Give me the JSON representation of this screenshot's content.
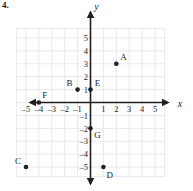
{
  "problem": {
    "number": "4."
  },
  "chart_data": {
    "type": "scatter",
    "title": "",
    "xlabel": "x",
    "ylabel": "y",
    "xlim": [
      -6,
      6
    ],
    "ylim": [
      -6,
      6
    ],
    "grid": true,
    "legend": "none",
    "x_ticks": [
      -5,
      -4,
      -3,
      -2,
      -1,
      1,
      2,
      3,
      4,
      5
    ],
    "y_ticks": [
      5,
      4,
      3,
      2,
      1,
      -1,
      -2,
      -3,
      -4,
      -5
    ],
    "x_tick_labels": [
      "-5",
      "-4",
      "-3",
      "-2",
      "-1",
      "1",
      "2",
      "3",
      "4",
      "5"
    ],
    "y_tick_labels": [
      "5",
      "4",
      "3",
      "2",
      "1",
      "-1",
      "-2",
      "-3",
      "-4",
      "-5"
    ],
    "points": [
      {
        "label": "A",
        "x": 2,
        "y": 3,
        "label_dx": 0.55,
        "label_dy": 0.55
      },
      {
        "label": "B",
        "x": -1,
        "y": 1,
        "label_dx": -0.62,
        "label_dy": 0.52
      },
      {
        "label": "C",
        "x": -5,
        "y": -5,
        "label_dx": -0.62,
        "label_dy": 0.45
      },
      {
        "label": "D",
        "x": 1,
        "y": -5,
        "label_dx": 0.5,
        "label_dy": -0.62
      },
      {
        "label": "E",
        "x": 0,
        "y": 1,
        "label_dx": 0.55,
        "label_dy": 0.52
      },
      {
        "label": "F",
        "x": -4,
        "y": 0,
        "label_dx": 0.45,
        "label_dy": 0.55
      },
      {
        "label": "G",
        "x": 0,
        "y": -2,
        "label_dx": 0.55,
        "label_dy": -0.55
      }
    ]
  },
  "colors": {
    "ink": "#231f20",
    "grid": "#e9e7ee",
    "background": "#ffffff"
  }
}
